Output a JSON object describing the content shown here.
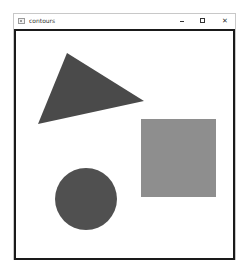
{
  "window": {
    "title": "contours",
    "controls": {
      "minimize": "minimize",
      "maximize": "maximize",
      "close": "✕"
    }
  },
  "canvas": {
    "background": "#ffffff",
    "shapes": [
      {
        "type": "triangle",
        "name": "triangle",
        "points": "66,52 143,100 37,123",
        "color": "#4a4a4a"
      },
      {
        "type": "rectangle",
        "name": "square",
        "x": 140,
        "y": 118,
        "width": 75,
        "height": 78,
        "color": "#8e8e8e"
      },
      {
        "type": "circle",
        "name": "circle",
        "cx": 85,
        "cy": 198,
        "r": 31,
        "color": "#505050"
      }
    ]
  }
}
